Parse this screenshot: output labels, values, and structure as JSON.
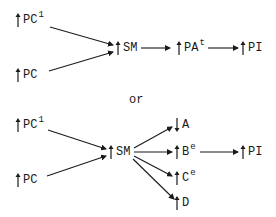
{
  "diagram_top": {
    "nodes": {
      "pc1": {
        "direction": "up",
        "label": "PC",
        "sup": "1"
      },
      "pc": {
        "direction": "up",
        "label": "PC",
        "sup": ""
      },
      "sm": {
        "direction": "up",
        "label": "SM",
        "sup": ""
      },
      "pat": {
        "direction": "up",
        "label": "PA",
        "sup": "t"
      },
      "pi": {
        "direction": "up",
        "label": "PI",
        "sup": ""
      }
    },
    "edges": [
      {
        "from": "PC1",
        "to": "SM"
      },
      {
        "from": "PC",
        "to": "SM"
      },
      {
        "from": "SM",
        "to": "PAt"
      },
      {
        "from": "PAt",
        "to": "PI"
      }
    ]
  },
  "separator": {
    "label": "or"
  },
  "diagram_bottom": {
    "nodes": {
      "pc1": {
        "direction": "up",
        "label": "PC",
        "sup": "1"
      },
      "pc": {
        "direction": "up",
        "label": "PC",
        "sup": ""
      },
      "sm": {
        "direction": "up",
        "label": "SM",
        "sup": ""
      },
      "a": {
        "direction": "down",
        "label": "A",
        "sup": ""
      },
      "be": {
        "direction": "up",
        "label": "B",
        "sup": "e"
      },
      "pi": {
        "direction": "up",
        "label": "PI",
        "sup": ""
      },
      "ce": {
        "direction": "up",
        "label": "C",
        "sup": "e"
      },
      "d": {
        "direction": "up",
        "label": "D",
        "sup": ""
      }
    },
    "edges": [
      {
        "from": "PC1",
        "to": "SM"
      },
      {
        "from": "PC",
        "to": "SM"
      },
      {
        "from": "SM",
        "to": "A"
      },
      {
        "from": "SM",
        "to": "Be"
      },
      {
        "from": "SM",
        "to": "Ce"
      },
      {
        "from": "SM",
        "to": "D"
      },
      {
        "from": "Be",
        "to": "PI"
      }
    ]
  },
  "colors": {
    "ink": "#1a1a1a",
    "background": "#ffffff"
  }
}
